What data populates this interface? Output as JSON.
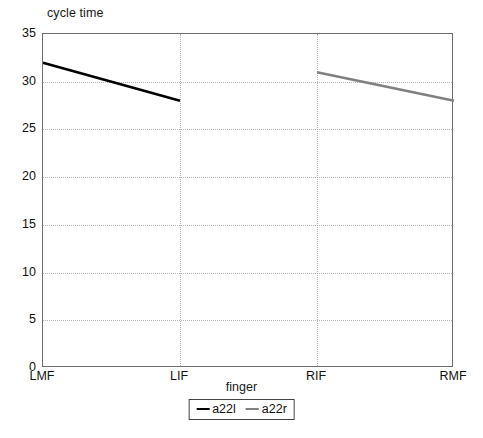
{
  "chart_data": {
    "type": "line",
    "title": "cycle time",
    "xlabel": "finger",
    "ylabel": "",
    "categories": [
      "LMF",
      "LIF",
      "RIF",
      "RMF"
    ],
    "ylim": [
      0,
      35
    ],
    "yticks": [
      0,
      5,
      10,
      15,
      20,
      25,
      30,
      35
    ],
    "grid": true,
    "legend_position": "bottom",
    "series": [
      {
        "name": "a22l",
        "color": "#000000",
        "x": [
          "LMF",
          "LIF"
        ],
        "values": [
          32,
          28
        ]
      },
      {
        "name": "a22r",
        "color": "#808080",
        "x": [
          "RIF",
          "RMF"
        ],
        "values": [
          31,
          28
        ]
      }
    ]
  },
  "legend": {
    "items": [
      {
        "label": "a22l",
        "color": "#000000"
      },
      {
        "label": "a22r",
        "color": "#808080"
      }
    ]
  }
}
